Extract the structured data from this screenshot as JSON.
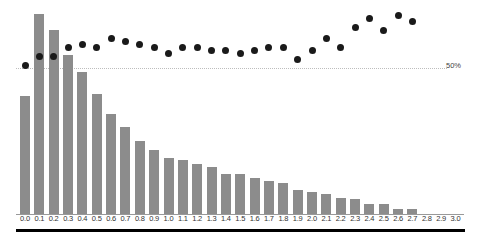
{
  "chart_data": {
    "type": "bar",
    "title": "",
    "xlabel": "",
    "ylabel": "",
    "grid": false,
    "legend": null,
    "categories": [
      "0.0",
      "0.1",
      "0.2",
      "0.3",
      "0.4",
      "0.5",
      "0.6",
      "0.7",
      "0.8",
      "0.9",
      "1.0",
      "1.1",
      "1.2",
      "1.3",
      "1.4",
      "1.5",
      "1.6",
      "1.7",
      "1.8",
      "1.9",
      "2.0",
      "2.1",
      "2.2",
      "2.3",
      "2.4",
      "2.5",
      "2.6",
      "2.7",
      "2.8",
      "2.9",
      "3.0"
    ],
    "series": [
      {
        "name": "count",
        "type": "bar",
        "color": "#8c8c8c",
        "values": [
          118,
          200,
          184,
          159,
          142,
          120,
          100,
          87,
          73,
          64,
          56,
          54,
          50,
          47,
          40,
          40,
          36,
          33,
          31,
          24,
          22,
          20,
          16,
          15,
          10,
          10,
          5,
          5,
          0,
          0,
          0
        ]
      },
      {
        "name": "percentage",
        "type": "scatter",
        "color": "#1a1a1a",
        "unit": "%",
        "values": [
          51,
          54,
          54,
          57,
          58,
          57,
          60,
          59,
          58,
          57,
          55,
          57,
          57,
          56,
          56,
          55,
          56,
          57,
          57,
          53,
          56,
          60,
          57,
          64,
          67,
          63,
          68,
          66,
          null,
          null,
          null
        ]
      }
    ],
    "reference_line": {
      "value": 50,
      "label": "50%"
    },
    "ylim_bars": [
      0,
      200
    ],
    "ylim_percent": [
      0,
      100
    ]
  },
  "labels": {
    "reference": "50%"
  }
}
